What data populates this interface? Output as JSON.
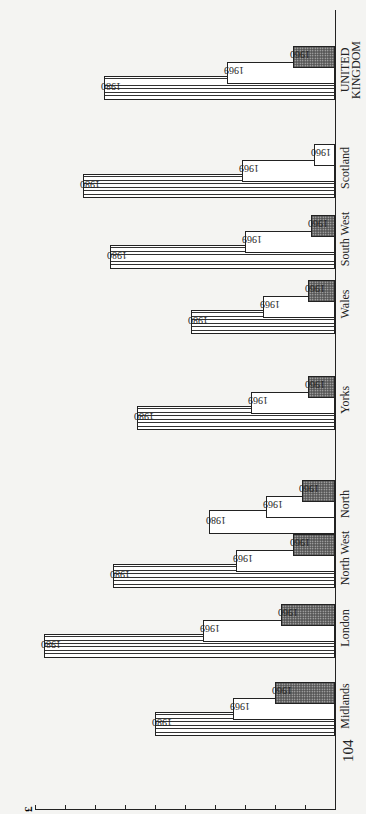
{
  "page": {
    "number": "104"
  },
  "chart_data": {
    "type": "bar",
    "orientation": "rotated 90° counter-clockwise on page (vertical bars read sideways)",
    "title": "",
    "ylabel": "£",
    "xlabel": "",
    "ylim": [
      300,
      1300
    ],
    "yticks": [
      "300",
      "400",
      "500",
      "600",
      "700",
      "800",
      "900",
      "1000",
      "1100",
      "1200",
      "1300"
    ],
    "grid": false,
    "legend": "year labels placed beside each bar",
    "categories": [
      "Midlands",
      "London",
      "North West",
      "North",
      "Yorks",
      "Wales",
      "South West",
      "Scotland",
      "UNITED KINGDOM"
    ],
    "series": [
      {
        "name": "1960",
        "values": [
          500,
          480,
          440,
          410,
          390,
          390,
          380,
          370,
          440
        ]
      },
      {
        "name": "1969",
        "values": [
          640,
          740,
          630,
          530,
          580,
          540,
          600,
          610,
          660
        ]
      },
      {
        "name": "1980",
        "values": [
          900,
          1270,
          1040,
          720,
          960,
          780,
          1050,
          1140,
          1070
        ]
      }
    ]
  },
  "labels": {
    "unit": "£",
    "y1960": "1960",
    "y1969": "1969",
    "y1980": "1980",
    "regions": [
      "Midlands",
      "London",
      "North West",
      "North",
      "Yorks",
      "Wales",
      "South West",
      "Scotland",
      "UNITED\nKINGDOM"
    ]
  },
  "style": {
    "hatch_1980": "horizontal lines (vertical in natural orientation)",
    "fill_1960": "dark stipple",
    "north_1980_plain": true,
    "scotland_1960_plain": true
  }
}
